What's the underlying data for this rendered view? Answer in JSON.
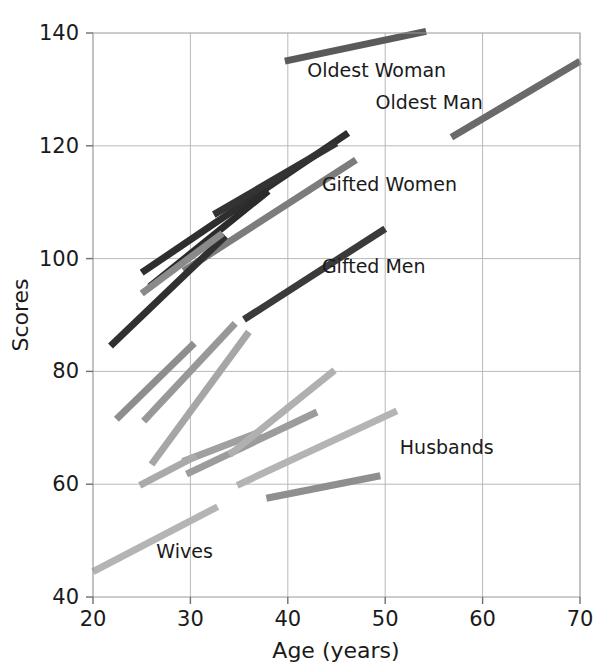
{
  "chart_data": {
    "type": "line",
    "title": "",
    "subtitle": "",
    "xlabel": "Age (years)",
    "ylabel": "Scores",
    "xlim": [
      20,
      70
    ],
    "ylim": [
      40,
      140
    ],
    "xticks": [
      20,
      30,
      40,
      50,
      60,
      70
    ],
    "yticks": [
      40,
      60,
      80,
      100,
      120,
      140
    ],
    "xtick_labels": [
      "20",
      "30",
      "40",
      "50",
      "60",
      "70"
    ],
    "ytick_labels": [
      "40",
      "60",
      "80",
      "100",
      "120",
      "140"
    ],
    "grid": true,
    "legend_position": "inline-annotations",
    "note": "Each segment is a separate longitudinal growth trajectory drawn between its start and end age.",
    "series": [
      {
        "name": "Oldest Woman",
        "label": "Oldest Woman",
        "color": "#5a5a5a",
        "width": 7,
        "x": [
          39.7,
          54.2
        ],
        "y": [
          135.0,
          140.3
        ],
        "label_x": 42.0,
        "label_y": 132.2
      },
      {
        "name": "Oldest Man",
        "label": "Oldest Man",
        "color": "#6a6a6a",
        "width": 7,
        "x": [
          56.8,
          70.0
        ],
        "y": [
          121.5,
          135.0
        ],
        "label_x": 49.0,
        "label_y": 126.5
      },
      {
        "name": "Gifted Women",
        "label": "Gifted Women",
        "color": "#7c7c7c",
        "width": 7,
        "x": [
          29.3,
          47.0
        ],
        "y": [
          97.8,
          117.5
        ],
        "label_x": 43.5,
        "label_y": 112.0
      },
      {
        "name": "Gifted Men",
        "label": "Gifted Men",
        "color": "#3a3a3a",
        "width": 7,
        "x": [
          35.5,
          50.0
        ],
        "y": [
          89.2,
          105.3
        ],
        "label_x": 43.5,
        "label_y": 97.5
      },
      {
        "name": "Husbands",
        "label": "Husbands",
        "color": "#b4b4b4",
        "width": 7,
        "x": [
          34.8,
          51.2
        ],
        "y": [
          59.8,
          73.0
        ],
        "label_x": 51.5,
        "label_y": 65.3
      },
      {
        "name": "Wives",
        "label": "Wives",
        "color": "#b4b4b4",
        "width": 7,
        "x": [
          20.0,
          32.8
        ],
        "y": [
          44.5,
          56.0
        ],
        "label_x": 26.5,
        "label_y": 47.0
      },
      {
        "name": "unlabeled-dark-1",
        "label": "",
        "color": "#2e2e2e",
        "width": 7,
        "x": [
          25.0,
          46.2
        ],
        "y": [
          97.5,
          122.3
        ],
        "label_x": null,
        "label_y": null
      },
      {
        "name": "unlabeled-dark-2",
        "label": "",
        "color": "#2b2b2b",
        "width": 7,
        "x": [
          25.8,
          38.0
        ],
        "y": [
          95.0,
          112.0
        ],
        "label_x": null,
        "label_y": null
      },
      {
        "name": "unlabeled-dark-3",
        "label": "",
        "color": "#333333",
        "width": 7,
        "x": [
          32.4,
          45.0
        ],
        "y": [
          107.8,
          120.5
        ],
        "label_x": null,
        "label_y": null
      },
      {
        "name": "unlabeled-dark-4",
        "label": "",
        "color": "#303030",
        "width": 7,
        "x": [
          21.8,
          33.6
        ],
        "y": [
          84.5,
          104.0
        ],
        "label_x": null,
        "label_y": null
      },
      {
        "name": "unlabeled-mid-1",
        "label": "",
        "color": "#8a8a8a",
        "width": 7,
        "x": [
          25.0,
          33.3
        ],
        "y": [
          93.8,
          104.5
        ],
        "label_x": null,
        "label_y": null
      },
      {
        "name": "unlabeled-mid-2",
        "label": "",
        "color": "#8e8e8e",
        "width": 7,
        "x": [
          22.4,
          30.4
        ],
        "y": [
          71.5,
          85.0
        ],
        "label_x": null,
        "label_y": null
      },
      {
        "name": "unlabeled-mid-3",
        "label": "",
        "color": "#989898",
        "width": 7,
        "x": [
          25.2,
          34.6
        ],
        "y": [
          71.2,
          88.5
        ],
        "label_x": null,
        "label_y": null
      },
      {
        "name": "unlabeled-mid-4",
        "label": "",
        "color": "#a6a6a6",
        "width": 7,
        "x": [
          26.0,
          36.0
        ],
        "y": [
          63.5,
          87.0
        ],
        "label_x": null,
        "label_y": null
      },
      {
        "name": "unlabeled-mid-5",
        "label": "",
        "color": "#9c9c9c",
        "width": 7,
        "x": [
          29.6,
          43.0
        ],
        "y": [
          61.8,
          72.8
        ],
        "label_x": null,
        "label_y": null
      },
      {
        "name": "unlabeled-mid-6",
        "label": "",
        "color": "#a0a0a0",
        "width": 7,
        "x": [
          29.2,
          37.2
        ],
        "y": [
          64.0,
          69.3
        ],
        "label_x": null,
        "label_y": null
      },
      {
        "name": "unlabeled-mid-7",
        "label": "",
        "color": "#aaaaaa",
        "width": 7,
        "x": [
          24.8,
          30.6
        ],
        "y": [
          59.8,
          65.0
        ],
        "label_x": null,
        "label_y": null
      },
      {
        "name": "unlabeled-mid-8",
        "label": "",
        "color": "#b0b0b0",
        "width": 7,
        "x": [
          34.0,
          44.8
        ],
        "y": [
          65.2,
          80.2
        ],
        "label_x": null,
        "label_y": null
      },
      {
        "name": "unlabeled-mid-9",
        "label": "",
        "color": "#8f8f8f",
        "width": 7,
        "x": [
          37.8,
          49.5
        ],
        "y": [
          57.5,
          61.5
        ],
        "label_x": null,
        "label_y": null
      }
    ]
  }
}
